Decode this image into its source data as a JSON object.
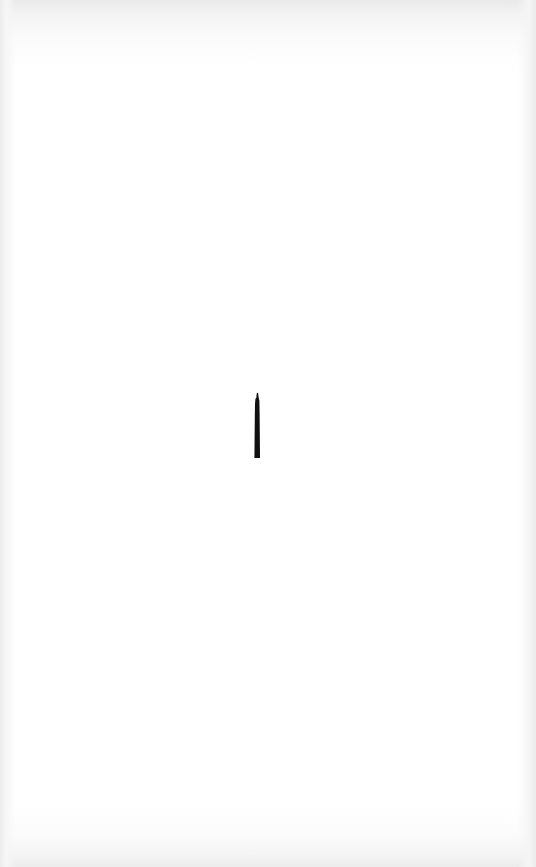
{
  "document": {
    "type": "scanned-page",
    "background_color": "#ffffff",
    "edge_shadow_color": "#e9e9e9",
    "handwritten_mark": {
      "text": "1",
      "color": "#111111",
      "position": {
        "x": 254,
        "y": 392,
        "width": 6,
        "height": 66
      }
    }
  }
}
